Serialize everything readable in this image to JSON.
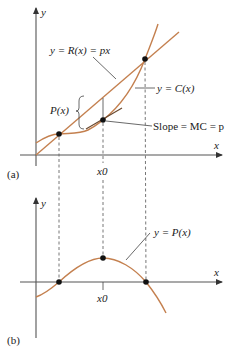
{
  "figure": {
    "panel_a": {
      "tag": "(a)",
      "y_axis_label": "y",
      "x_axis_label": "x",
      "revenue_label": "y = R(x) = px",
      "cost_label": "y = C(x)",
      "profit_bracket_label": "P(x)",
      "slope_label": "Slope = MC = p",
      "x0_label": "x0"
    },
    "panel_b": {
      "tag": "(b)",
      "y_axis_label": "y",
      "x_axis_label": "x",
      "profit_label": "y = P(x)",
      "x0_label": "x0"
    },
    "colors": {
      "curve": "#c4804f",
      "axis": "#555555",
      "dot": "#111111"
    }
  }
}
